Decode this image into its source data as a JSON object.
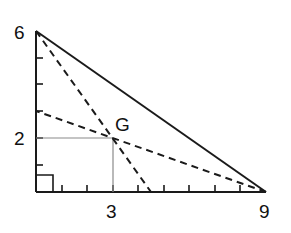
{
  "diagram": {
    "type": "right-triangle-centroid",
    "vertices": {
      "top": {
        "x": 0,
        "y": 6
      },
      "origin": {
        "x": 0,
        "y": 0
      },
      "right": {
        "x": 9,
        "y": 0
      }
    },
    "centroid": {
      "label": "G",
      "x": 3,
      "y": 2
    },
    "labels": {
      "y_top": "6",
      "y_mid": "2",
      "x_mid": "3",
      "x_right": "9",
      "point": "G"
    },
    "medians_shown": [
      {
        "from": [
          0,
          6
        ],
        "to": [
          4.5,
          0
        ]
      },
      {
        "from": [
          9,
          0
        ],
        "to": [
          0,
          3
        ]
      }
    ],
    "y_ticks": [
      1,
      2,
      3,
      4,
      5
    ],
    "x_ticks": [
      1,
      2,
      3,
      4,
      5,
      6,
      7,
      8
    ],
    "right_angle_marker": true,
    "colors": {
      "stroke": "#1a1a1a",
      "guide": "#8a8a8a"
    }
  }
}
